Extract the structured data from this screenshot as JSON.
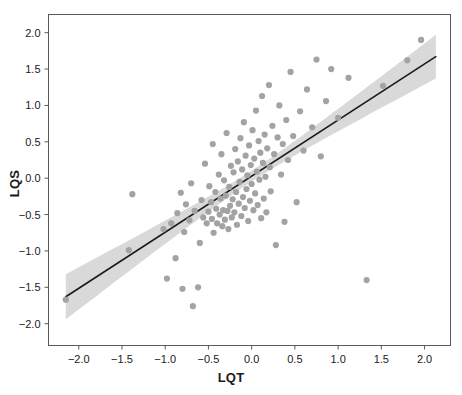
{
  "chart_data": {
    "type": "scatter",
    "title": "",
    "subtitle": "",
    "xlabel": "LQT",
    "ylabel": "LQS",
    "xlim": [
      -2.35,
      2.3
    ],
    "ylim": [
      -2.3,
      2.25
    ],
    "xticks": [
      -2.0,
      -1.5,
      -1.0,
      -0.5,
      0.0,
      0.5,
      1.0,
      1.5,
      2.0
    ],
    "yticks": [
      -2.0,
      -1.5,
      -1.0,
      -0.5,
      0.0,
      0.5,
      1.0,
      1.5,
      2.0
    ],
    "xticklabels": [
      "−2.0",
      "−1.5",
      "−1.0",
      "−0.5",
      "0.0",
      "0.5",
      "1.0",
      "1.5",
      "2.0"
    ],
    "yticklabels": [
      "−2.0",
      "−1.5",
      "−1.0",
      "−0.5",
      "0.0",
      "0.5",
      "1.0",
      "1.5",
      "2.0"
    ],
    "grid": false,
    "legend": null,
    "legend_position": "none",
    "point_color": "#a3a3a3",
    "line_color": "#1a1a1a",
    "band_color": "#d9d9d9",
    "frame_color": "#5a5a5a",
    "point_radius": 3.1,
    "fit": {
      "type": "linear",
      "slope": 0.771,
      "intercept": 0.028,
      "x_start": -2.15,
      "x_end": 2.13,
      "y_start": -1.63,
      "y_end": 1.67,
      "band_halfwidth_at_xstart": 0.31,
      "band_halfwidth_at_center": 0.075,
      "band_halfwidth_at_xend": 0.3,
      "band_center_x": 0.02
    },
    "series": [
      {
        "name": "observations",
        "n": 118,
        "points": [
          [
            -2.15,
            -1.67
          ],
          [
            -1.42,
            -0.99
          ],
          [
            -1.38,
            -0.22
          ],
          [
            -1.02,
            -0.7
          ],
          [
            -0.98,
            -1.38
          ],
          [
            -0.93,
            -0.62
          ],
          [
            -0.88,
            -1.1
          ],
          [
            -0.86,
            -0.48
          ],
          [
            -0.82,
            -0.2
          ],
          [
            -0.8,
            -1.52
          ],
          [
            -0.78,
            -0.74
          ],
          [
            -0.76,
            -0.36
          ],
          [
            -0.72,
            -0.58
          ],
          [
            -0.7,
            -0.07
          ],
          [
            -0.68,
            -1.76
          ],
          [
            -0.66,
            -0.45
          ],
          [
            -0.62,
            -1.5
          ],
          [
            -0.6,
            -0.89
          ],
          [
            -0.58,
            -0.3
          ],
          [
            -0.56,
            -0.54
          ],
          [
            -0.54,
            0.2
          ],
          [
            -0.52,
            -0.62
          ],
          [
            -0.5,
            -0.46
          ],
          [
            -0.49,
            -0.11
          ],
          [
            -0.47,
            -0.33
          ],
          [
            -0.46,
            -0.56
          ],
          [
            -0.45,
            0.47
          ],
          [
            -0.44,
            -0.75
          ],
          [
            -0.42,
            -0.19
          ],
          [
            -0.41,
            -0.42
          ],
          [
            -0.4,
            -0.62
          ],
          [
            -0.38,
            0.05
          ],
          [
            -0.37,
            -0.5
          ],
          [
            -0.36,
            -0.28
          ],
          [
            -0.35,
            0.33
          ],
          [
            -0.34,
            -0.66
          ],
          [
            -0.33,
            -0.44
          ],
          [
            -0.32,
            -0.03
          ],
          [
            -0.31,
            -0.57
          ],
          [
            -0.3,
            -0.24
          ],
          [
            -0.29,
            0.62
          ],
          [
            -0.28,
            -0.45
          ],
          [
            -0.27,
            -0.7
          ],
          [
            -0.26,
            -0.12
          ],
          [
            -0.25,
            -0.38
          ],
          [
            -0.24,
            0.17
          ],
          [
            -0.23,
            -0.54
          ],
          [
            -0.22,
            -0.29
          ],
          [
            -0.21,
            0.08
          ],
          [
            -0.2,
            -0.47
          ],
          [
            -0.19,
            0.4
          ],
          [
            -0.18,
            -0.19
          ],
          [
            -0.17,
            -0.64
          ],
          [
            -0.16,
            0.23
          ],
          [
            -0.15,
            -0.35
          ],
          [
            -0.14,
            -0.05
          ],
          [
            -0.13,
            0.55
          ],
          [
            -0.12,
            -0.52
          ],
          [
            -0.11,
            0.12
          ],
          [
            -0.1,
            -0.26
          ],
          [
            -0.09,
            0.77
          ],
          [
            -0.08,
            -0.41
          ],
          [
            -0.07,
            0.31
          ],
          [
            -0.06,
            -0.15
          ],
          [
            -0.05,
            0.04
          ],
          [
            -0.04,
            -0.59
          ],
          [
            -0.03,
            0.45
          ],
          [
            -0.02,
            -0.31
          ],
          [
            -0.01,
            0.18
          ],
          [
            0.0,
            -0.08
          ],
          [
            0.01,
            0.66
          ],
          [
            0.02,
            -0.44
          ],
          [
            0.03,
            0.27
          ],
          [
            0.04,
            -0.21
          ],
          [
            0.05,
            0.93
          ],
          [
            0.06,
            0.09
          ],
          [
            0.07,
            -0.37
          ],
          [
            0.08,
            0.51
          ],
          [
            0.09,
            -0.02
          ],
          [
            0.1,
            0.35
          ],
          [
            0.11,
            -0.55
          ],
          [
            0.12,
            1.13
          ],
          [
            0.13,
            0.21
          ],
          [
            0.14,
            -0.28
          ],
          [
            0.15,
            0.6
          ],
          [
            0.16,
            0.02
          ],
          [
            0.17,
            -0.47
          ],
          [
            0.18,
            0.41
          ],
          [
            0.2,
            1.28
          ],
          [
            0.21,
            0.15
          ],
          [
            0.22,
            -0.18
          ],
          [
            0.24,
            0.72
          ],
          [
            0.26,
            0.33
          ],
          [
            0.28,
            -0.92
          ],
          [
            0.3,
            0.56
          ],
          [
            0.32,
            1.0
          ],
          [
            0.34,
            0.05
          ],
          [
            0.36,
            0.47
          ],
          [
            0.38,
            -0.6
          ],
          [
            0.4,
            0.8
          ],
          [
            0.42,
            0.25
          ],
          [
            0.45,
            1.46
          ],
          [
            0.48,
            0.58
          ],
          [
            0.52,
            -0.33
          ],
          [
            0.56,
            0.92
          ],
          [
            0.6,
            0.38
          ],
          [
            0.64,
            1.22
          ],
          [
            0.7,
            0.7
          ],
          [
            0.75,
            1.63
          ],
          [
            0.8,
            0.3
          ],
          [
            0.86,
            1.06
          ],
          [
            0.92,
            1.5
          ],
          [
            1.0,
            0.83
          ],
          [
            1.12,
            1.38
          ],
          [
            1.33,
            -1.4
          ],
          [
            1.52,
            1.27
          ],
          [
            1.8,
            1.62
          ],
          [
            1.96,
            1.9
          ]
        ]
      }
    ]
  }
}
